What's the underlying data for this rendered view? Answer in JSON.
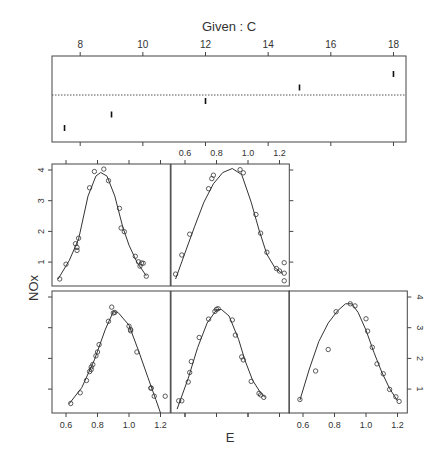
{
  "chart_data": {
    "type": "scatter",
    "title": "Given : C",
    "xlabel": "E",
    "ylabel": "NOx",
    "given": {
      "label": "Given : C",
      "ticks": [
        8,
        10,
        12,
        14,
        16,
        18
      ],
      "range": [
        7.1,
        18.4
      ],
      "intervals": [
        {
          "lo": 7.5,
          "hi": 7.5
        },
        {
          "lo": 9.0,
          "hi": 9.0
        },
        {
          "lo": 12.0,
          "hi": 12.0
        },
        {
          "lo": 15.0,
          "hi": 15.0
        },
        {
          "lo": 18.0,
          "hi": 18.0
        }
      ]
    },
    "xticks": [
      0.6,
      0.8,
      1.0,
      1.2
    ],
    "xtick_labels": [
      "0.6",
      "0.8",
      "1.0",
      "1.2"
    ],
    "yticks": [
      1,
      2,
      3,
      4
    ],
    "ytick_labels": [
      "1",
      "2",
      "3",
      "4"
    ],
    "xlim": [
      0.51,
      1.26
    ],
    "ylim": [
      0.2,
      4.13
    ],
    "layout": {
      "rows": 2,
      "cols": 3,
      "order": "bottom-left first, left to right, then upward"
    },
    "panels": [
      {
        "given_C": 7.5,
        "points": [
          [
            0.63,
            0.53
          ],
          [
            0.69,
            0.88
          ],
          [
            0.73,
            1.28
          ],
          [
            0.75,
            1.57
          ],
          [
            0.76,
            1.64
          ],
          [
            0.76,
            1.72
          ],
          [
            0.77,
            1.8
          ],
          [
            0.79,
            2.08
          ],
          [
            0.8,
            2.21
          ],
          [
            0.81,
            2.45
          ],
          [
            0.87,
            3.21
          ],
          [
            0.89,
            3.67
          ],
          [
            0.9,
            3.48
          ],
          [
            0.91,
            3.5
          ],
          [
            1.0,
            3.05
          ],
          [
            1.01,
            2.94
          ],
          [
            1.01,
            2.9
          ],
          [
            1.05,
            2.21
          ],
          [
            1.14,
            1.04
          ],
          [
            1.14,
            1.03
          ],
          [
            1.16,
            0.77
          ],
          [
            1.23,
            0.77
          ]
        ],
        "curve": [
          [
            0.62,
            0.52
          ],
          [
            0.7,
            1.05
          ],
          [
            0.78,
            1.95
          ],
          [
            0.85,
            2.95
          ],
          [
            0.9,
            3.52
          ],
          [
            0.93,
            3.5
          ],
          [
            1.0,
            3.08
          ],
          [
            1.06,
            2.25
          ],
          [
            1.12,
            1.38
          ],
          [
            1.17,
            0.66
          ],
          [
            1.2,
            0.22
          ]
        ]
      },
      {
        "given_C": 9.0,
        "points": [
          [
            0.56,
            0.62
          ],
          [
            0.58,
            0.62
          ],
          [
            0.62,
            1.23
          ],
          [
            0.63,
            1.54
          ],
          [
            0.64,
            1.9
          ],
          [
            0.69,
            2.68
          ],
          [
            0.75,
            3.28
          ],
          [
            0.79,
            3.53
          ],
          [
            0.8,
            3.6
          ],
          [
            0.81,
            3.62
          ],
          [
            0.9,
            3.25
          ],
          [
            0.92,
            2.76
          ],
          [
            0.96,
            2.05
          ],
          [
            0.97,
            1.95
          ],
          [
            1.02,
            1.25
          ],
          [
            1.07,
            0.86
          ],
          [
            1.08,
            0.81
          ],
          [
            1.1,
            0.73
          ]
        ],
        "curve": [
          [
            0.55,
            0.35
          ],
          [
            0.62,
            1.35
          ],
          [
            0.68,
            2.35
          ],
          [
            0.74,
            3.15
          ],
          [
            0.8,
            3.58
          ],
          [
            0.83,
            3.6
          ],
          [
            0.88,
            3.38
          ],
          [
            0.94,
            2.62
          ],
          [
            0.98,
            1.95
          ],
          [
            1.03,
            1.28
          ],
          [
            1.08,
            0.88
          ],
          [
            1.11,
            0.72
          ]
        ]
      },
      {
        "given_C": 12.0,
        "points": [
          [
            0.58,
            0.66
          ],
          [
            0.68,
            1.59
          ],
          [
            0.76,
            2.29
          ],
          [
            0.81,
            3.52
          ],
          [
            0.9,
            3.78
          ],
          [
            0.93,
            3.71
          ],
          [
            1.0,
            3.29
          ],
          [
            1.01,
            2.89
          ],
          [
            1.04,
            2.36
          ],
          [
            1.07,
            1.82
          ],
          [
            1.11,
            1.5
          ],
          [
            1.15,
            0.99
          ],
          [
            1.19,
            0.75
          ],
          [
            1.21,
            0.6
          ]
        ],
        "curve": [
          [
            0.58,
            0.64
          ],
          [
            0.64,
            1.65
          ],
          [
            0.7,
            2.55
          ],
          [
            0.76,
            3.15
          ],
          [
            0.82,
            3.55
          ],
          [
            0.87,
            3.78
          ],
          [
            0.91,
            3.78
          ],
          [
            0.95,
            3.5
          ],
          [
            1.0,
            2.92
          ],
          [
            1.05,
            2.2
          ],
          [
            1.1,
            1.55
          ],
          [
            1.15,
            1.02
          ],
          [
            1.2,
            0.62
          ]
        ]
      },
      {
        "given_C": 15.0,
        "points": [
          [
            0.56,
            0.45
          ],
          [
            0.6,
            0.93
          ],
          [
            0.66,
            1.6
          ],
          [
            0.67,
            1.48
          ],
          [
            0.67,
            1.38
          ],
          [
            0.68,
            1.78
          ],
          [
            0.75,
            3.42
          ],
          [
            0.78,
            3.95
          ],
          [
            0.84,
            4.03
          ],
          [
            0.87,
            3.65
          ],
          [
            0.94,
            2.75
          ],
          [
            0.95,
            2.11
          ],
          [
            0.97,
            1.99
          ],
          [
            1.04,
            1.19
          ],
          [
            1.06,
            1.01
          ],
          [
            1.07,
            0.87
          ],
          [
            1.08,
            0.97
          ],
          [
            1.09,
            0.96
          ],
          [
            1.11,
            0.54
          ]
        ],
        "curve": [
          [
            0.55,
            0.45
          ],
          [
            0.62,
            1.05
          ],
          [
            0.68,
            1.75
          ],
          [
            0.74,
            3.15
          ],
          [
            0.79,
            3.8
          ],
          [
            0.82,
            3.92
          ],
          [
            0.86,
            3.8
          ],
          [
            0.91,
            3.15
          ],
          [
            0.96,
            2.15
          ],
          [
            1.0,
            1.55
          ],
          [
            1.05,
            1.0
          ],
          [
            1.11,
            0.55
          ]
        ]
      },
      {
        "given_C": 18.0,
        "points": [
          [
            0.54,
            0.61
          ],
          [
            0.58,
            1.23
          ],
          [
            0.63,
            1.91
          ],
          [
            0.75,
            3.39
          ],
          [
            0.77,
            3.72
          ],
          [
            0.78,
            3.83
          ],
          [
            0.95,
            4.01
          ],
          [
            0.97,
            3.91
          ],
          [
            1.05,
            2.55
          ],
          [
            1.08,
            1.94
          ],
          [
            1.12,
            1.32
          ],
          [
            1.18,
            0.79
          ],
          [
            1.2,
            0.71
          ],
          [
            1.23,
            0.98
          ],
          [
            1.23,
            0.64
          ],
          [
            1.23,
            0.39
          ]
        ],
        "curve": [
          [
            0.54,
            0.45
          ],
          [
            0.6,
            1.3
          ],
          [
            0.66,
            2.15
          ],
          [
            0.72,
            2.95
          ],
          [
            0.78,
            3.55
          ],
          [
            0.84,
            3.92
          ],
          [
            0.9,
            4.05
          ],
          [
            0.96,
            3.85
          ],
          [
            1.02,
            2.95
          ],
          [
            1.07,
            2.05
          ],
          [
            1.12,
            1.25
          ],
          [
            1.17,
            0.82
          ],
          [
            1.22,
            0.62
          ]
        ]
      }
    ],
    "grid": false,
    "legend": null
  },
  "labels": {
    "given_title": "Given : C",
    "x_axis": "E",
    "y_axis": "NOx"
  }
}
